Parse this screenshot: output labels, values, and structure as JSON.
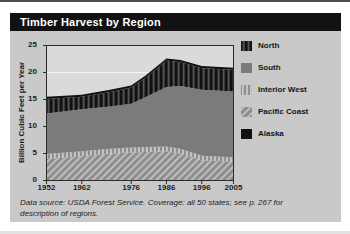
{
  "figure": {
    "title": "Timber Harvest by Region",
    "source_note": "Data source: USDA Forest Service. Coverage: all 50 states; see p. 267 for description of regions."
  },
  "colors": {
    "page_bg": "#ffffff",
    "top_strip": "#4d4d4d",
    "figure_bg": "#c9c9c9",
    "title_bar_bg": "#121212",
    "title_text": "#ffffff",
    "plot_bg": "#dadada",
    "frame": "#2b2b2b",
    "gridline": "#f4f4f4",
    "tick_text": "#1c1c1c",
    "south_fill": "#7b7b7b",
    "black_fill": "#111111",
    "north_stripe": "#525252",
    "texture_bg": "#8e8e8e",
    "texture_light": "#c9c9c9"
  },
  "chart_data": {
    "type": "area",
    "stacked": true,
    "title": "Timber Harvest by Region",
    "xlabel": "",
    "ylabel": "Billion Cubic Feet per Year",
    "xlim": [
      1952,
      2005
    ],
    "ylim": [
      0,
      25
    ],
    "x_ticks": [
      1952,
      1962,
      1976,
      1986,
      1996,
      2005
    ],
    "y_ticks": [
      0,
      5,
      10,
      15,
      20,
      25
    ],
    "grid": "horizontal-white-lines",
    "legend_position": "right",
    "x": [
      1952,
      1962,
      1970,
      1976,
      1980,
      1986,
      1990,
      1996,
      2005
    ],
    "series": [
      {
        "name": "Pacific Coast",
        "pattern": "diagonal-hatch",
        "values": [
          4.0,
          4.5,
          5.0,
          5.2,
          5.3,
          5.4,
          5.0,
          3.7,
          3.5
        ]
      },
      {
        "name": "Interior West",
        "pattern": "light-vertical-stripes",
        "values": [
          0.9,
          0.9,
          0.9,
          0.9,
          0.9,
          0.9,
          0.9,
          0.9,
          0.8
        ]
      },
      {
        "name": "South",
        "pattern": "solid-gray",
        "values": [
          7.5,
          7.8,
          7.8,
          8.1,
          9.2,
          11.0,
          11.6,
          12.2,
          12.2
        ]
      },
      {
        "name": "North",
        "pattern": "dark-vertical-stripes",
        "values": [
          2.7,
          2.3,
          2.7,
          3.0,
          3.6,
          4.9,
          4.4,
          4.0,
          4.0
        ]
      },
      {
        "name": "Alaska",
        "pattern": "solid-black",
        "values": [
          0.4,
          0.4,
          0.4,
          0.4,
          0.4,
          0.4,
          0.4,
          0.4,
          0.4
        ]
      }
    ],
    "stacking_order": "bottom-to-top",
    "legend_order": [
      "North",
      "South",
      "Interior West",
      "Pacific Coast",
      "Alaska"
    ]
  }
}
